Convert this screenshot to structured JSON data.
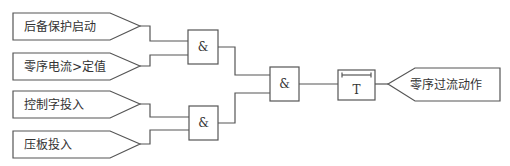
{
  "diagram": {
    "type": "logic-diagram",
    "inputs": [
      {
        "id": "in1",
        "label": "后备保护启动"
      },
      {
        "id": "in2",
        "label": "零序电流>定值"
      },
      {
        "id": "in3",
        "label": "控制字投入"
      },
      {
        "id": "in4",
        "label": "压板投入"
      }
    ],
    "gates": [
      {
        "id": "and1",
        "label": "&",
        "inputs": [
          "in1",
          "in2"
        ]
      },
      {
        "id": "and2",
        "label": "&",
        "inputs": [
          "in3",
          "in4"
        ]
      },
      {
        "id": "and3",
        "label": "&",
        "inputs": [
          "and1",
          "and2"
        ]
      }
    ],
    "timer": {
      "id": "timer",
      "label": "T",
      "input": "and3"
    },
    "output": {
      "id": "out",
      "label": "零序过流动作",
      "input": "timer"
    },
    "colors": {
      "line": "#555555",
      "background": "#ffffff",
      "text": "#333333"
    }
  }
}
